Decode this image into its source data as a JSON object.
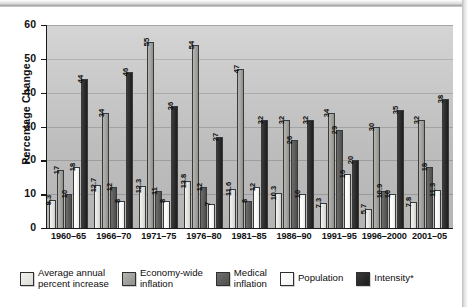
{
  "chart_data": {
    "type": "bar",
    "title": "",
    "xlabel": "",
    "ylabel": "Percentage Change",
    "ylim": [
      0,
      60
    ],
    "yticks": [
      0,
      10,
      20,
      30,
      40,
      50,
      60
    ],
    "grid": true,
    "legend_position": "bottom",
    "categories": [
      "1960–65",
      "1966–70",
      "1971–75",
      "1976–80",
      "1981–85",
      "1986–90",
      "1991–95",
      "1996–2000",
      "2001–05"
    ],
    "series": [
      {
        "name": "Average annual percent increase",
        "color": "#e3e3df",
        "values": [
          8.3,
          12.7,
          12.3,
          13.8,
          11.6,
          10.3,
          7.3,
          5.7,
          7.8
        ],
        "labels": [
          "8.3",
          "12.7",
          "12.3",
          "13.8",
          "11.6",
          "10.3",
          "7.3",
          "5.7",
          "7.8"
        ]
      },
      {
        "name": "Economy-wide inflation",
        "color": "#a3a39f",
        "values": [
          17,
          34,
          55,
          54,
          47,
          32,
          34,
          30,
          32
        ],
        "labels": [
          "17",
          "34",
          "55",
          "54",
          "47",
          "32",
          "34",
          "30",
          "32"
        ]
      },
      {
        "name": "Medical inflation",
        "color": "#5c5c5a",
        "values": [
          10,
          12,
          11,
          12,
          8,
          26,
          29,
          10.9,
          18
        ],
        "labels": [
          "10",
          "12",
          "11",
          "12",
          "8",
          "26",
          "29",
          "10.9",
          "18"
        ]
      },
      {
        "name": "Population",
        "color": "#fafaf8",
        "values": [
          18,
          8,
          8,
          7,
          12,
          10,
          16,
          10,
          11.3
        ],
        "labels": [
          "18",
          "8",
          "8",
          "7",
          "12",
          "10",
          "16",
          "10",
          "11.3"
        ]
      },
      {
        "name": "Intensity*",
        "color": "#2b2b2b",
        "values": [
          44,
          46,
          36,
          27,
          32,
          32,
          20,
          35,
          38
        ],
        "labels": [
          "44",
          "46",
          "36",
          "27",
          "32",
          "32",
          "20",
          "35",
          "38"
        ]
      }
    ]
  },
  "axis": {
    "y_title": "Percentage Change",
    "y_ticks": [
      "60",
      "50",
      "40",
      "30",
      "20",
      "10",
      "0"
    ]
  },
  "legend": {
    "items": [
      {
        "label": "Average annual\npercent increase"
      },
      {
        "label": "Economy-wide\ninflation"
      },
      {
        "label": "Medical\ninflation"
      },
      {
        "label": "Population"
      },
      {
        "label": "Intensity*"
      }
    ]
  }
}
